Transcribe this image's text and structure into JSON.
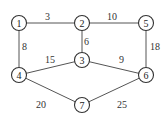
{
  "graph": {
    "nodes": [
      {
        "id": "1",
        "label": "1",
        "x": 19,
        "y": 23
      },
      {
        "id": "2",
        "label": "2",
        "x": 82,
        "y": 23
      },
      {
        "id": "5",
        "label": "5",
        "x": 146,
        "y": 23
      },
      {
        "id": "3",
        "label": "3",
        "x": 82,
        "y": 60
      },
      {
        "id": "4",
        "label": "4",
        "x": 19,
        "y": 75
      },
      {
        "id": "6",
        "label": "6",
        "x": 146,
        "y": 75
      },
      {
        "id": "7",
        "label": "7",
        "x": 82,
        "y": 105
      }
    ],
    "edges": [
      {
        "from": "1",
        "to": "2",
        "weight": "3"
      },
      {
        "from": "2",
        "to": "5",
        "weight": "10"
      },
      {
        "from": "1",
        "to": "4",
        "weight": "8"
      },
      {
        "from": "2",
        "to": "3",
        "weight": "6"
      },
      {
        "from": "5",
        "to": "6",
        "weight": "18"
      },
      {
        "from": "4",
        "to": "3",
        "weight": "15"
      },
      {
        "from": "3",
        "to": "6",
        "weight": "9"
      },
      {
        "from": "4",
        "to": "7",
        "weight": "20"
      },
      {
        "from": "7",
        "to": "6",
        "weight": "25"
      }
    ]
  }
}
